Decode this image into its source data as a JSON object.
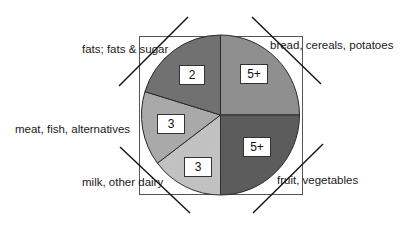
{
  "chart_data": {
    "type": "pie",
    "title": "",
    "start_angle_deg": 0,
    "direction": "clockwise",
    "categories": [
      "bread, cereals, potatoes",
      "fruit, vegetables",
      "milk, other dairy",
      "meat, fish, alternatives",
      "fats; fats & sugar"
    ],
    "values": [
      90,
      90,
      53,
      54,
      73
    ],
    "value_units": "degrees (approx. slice angle)",
    "data_labels": [
      "5+",
      "5+",
      "3",
      "3",
      "2"
    ],
    "colors": [
      "#8f8f8f",
      "#5c5c5c",
      "#c2c2c2",
      "#a9a9a9",
      "#717171"
    ],
    "legend": "none (category labels placed at corners with diagonal leader lines)",
    "frame": "rectangular border around pie"
  },
  "slices": [
    {
      "name": "bread, cereals, potatoes",
      "label": "bread, cereals, potatoes",
      "value_label": "5+",
      "start": 0,
      "end": 90,
      "color": "#8f8f8f"
    },
    {
      "name": "fruit, vegetables",
      "label": "fruit, vegetables",
      "value_label": "5+",
      "start": 90,
      "end": 180,
      "color": "#5c5c5c"
    },
    {
      "name": "milk, other dairy",
      "label": "milk, other dairy",
      "value_label": "3",
      "start": 180,
      "end": 233,
      "color": "#c2c2c2"
    },
    {
      "name": "meat, fish, alternatives",
      "label": "meat, fish, alternatives",
      "value_label": "3",
      "start": 233,
      "end": 287,
      "color": "#a9a9a9"
    },
    {
      "name": "fats; fats & sugar",
      "label": "fats; fats & sugar",
      "value_label": "2",
      "start": 287,
      "end": 360,
      "color": "#717171"
    }
  ]
}
